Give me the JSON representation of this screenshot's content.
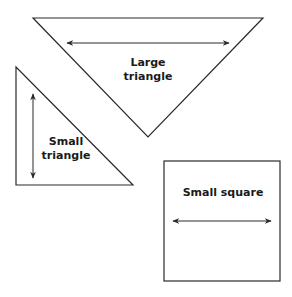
{
  "diagram": {
    "shapes": [
      {
        "id": "large-triangle",
        "label_line1": "Large",
        "label_line2": "triangle"
      },
      {
        "id": "small-triangle",
        "label_line1": "Small",
        "label_line2": "triangle"
      },
      {
        "id": "small-square",
        "label": "Small square"
      }
    ],
    "colors": {
      "stroke": "#2a2a2a",
      "background": "#ffffff",
      "text": "#1a1a1a"
    }
  }
}
